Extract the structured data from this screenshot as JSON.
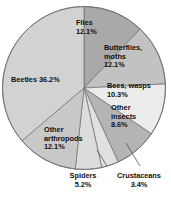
{
  "chart_data": {
    "type": "pie",
    "title": "",
    "subtitle": "",
    "xlabel": "",
    "ylabel": "",
    "grid": false,
    "legend": "none",
    "labels_inline": true,
    "units": "percent",
    "categories": [
      "Flies",
      "Butterflies, moths",
      "Bees, wasps",
      "Other insects",
      "Crustaceans",
      "Spiders",
      "Other arthropods",
      "Beetles"
    ],
    "values": [
      12.1,
      12.1,
      10.3,
      8.6,
      3.4,
      5.2,
      12.1,
      36.2
    ],
    "start_angle_deg": 0,
    "direction": "clockwise",
    "slice_colors": [
      "#a9a9a9",
      "#c2c2c2",
      "#ebebeb",
      "#b4b4b4",
      "#e0e0e0",
      "#dcdcdc",
      "#c8c8c8",
      "#d2d2d2"
    ],
    "slices": [
      {
        "name": "Flies",
        "value": 12.1,
        "label": "Flies\n12.1%",
        "color": "#a9a9a9",
        "leader": false
      },
      {
        "name": "Butterflies, moths",
        "value": 12.1,
        "label": "Butterflies,\nmoths\n12.1%",
        "color": "#c2c2c2",
        "leader": false
      },
      {
        "name": "Bees, wasps",
        "value": 10.3,
        "label": "Bees, wasps\n10.3%",
        "color": "#ebebeb",
        "leader": false
      },
      {
        "name": "Other insects",
        "value": 8.6,
        "label": "Other\ninsects\n8.6%",
        "color": "#b4b4b4",
        "leader": false
      },
      {
        "name": "Crustaceans",
        "value": 3.4,
        "label": "Crustaceans\n3.4%",
        "color": "#e0e0e0",
        "leader": true
      },
      {
        "name": "Spiders",
        "value": 5.2,
        "label": "Spiders\n5.2%",
        "color": "#dcdcdc",
        "leader": true
      },
      {
        "name": "Other arthropods",
        "value": 12.1,
        "label": "Other\narthropods\n12.1%",
        "color": "#c8c8c8",
        "leader": false
      },
      {
        "name": "Beetles",
        "value": 36.2,
        "label": "Beetles 36.2%",
        "color": "#d2d2d2",
        "leader": false
      }
    ]
  },
  "labels": {
    "flies": "Flies\n12.1%",
    "butterflies_moths": "Butterflies,\nmoths\n12.1%",
    "bees_wasps": "Bees, wasps\n10.3%",
    "other_insects": "Other\ninsects\n8.6%",
    "crustaceans": "Crustaceans\n3.4%",
    "spiders": "Spiders\n5.2%",
    "other_arthropods": "Other\narthropods\n12.1%",
    "beetles": "Beetles 36.2%"
  },
  "style": {
    "background": "#ffffff",
    "outline": "#6e6e6e",
    "leader_line": "#555555",
    "text": "#111111"
  }
}
